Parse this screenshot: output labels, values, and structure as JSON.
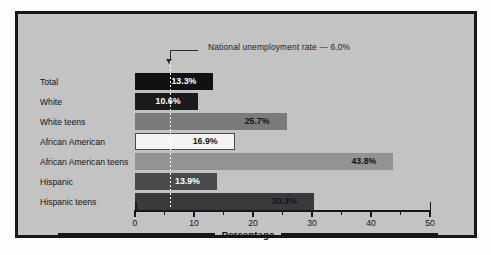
{
  "chart_data": {
    "type": "bar",
    "orientation": "horizontal",
    "title": "",
    "subtitle": "",
    "xlabel": "Percentage",
    "ylabel": "",
    "xlim": [
      0,
      50
    ],
    "xticks": [
      0,
      10,
      20,
      30,
      40,
      50
    ],
    "xtick_labels": [
      "0",
      "10",
      "20",
      "30",
      "40",
      "50"
    ],
    "minor_tick_interval": 5,
    "grid": false,
    "legend": "none",
    "categories": [
      "Total",
      "White",
      "White teens",
      "African American",
      "African American teens",
      "Hispanic",
      "Hispanic teens"
    ],
    "values": [
      13.3,
      10.6,
      25.7,
      16.9,
      43.8,
      13.9,
      30.3
    ],
    "value_labels": [
      "13.3%",
      "10.6%",
      "25.7%",
      "16.9%",
      "43.8%",
      "13.9%",
      "30.3%"
    ],
    "bar_colors": [
      "#111114",
      "#1b1b1e",
      "#7b7b7b",
      "#f4f4f2",
      "#939393",
      "#4a4a4c",
      "#3a3a3c"
    ],
    "label_colors": [
      "#ffffff",
      "#ffffff",
      "#141417",
      "#141417",
      "#141417",
      "#ffffff",
      "#141417"
    ],
    "annotations": [
      {
        "text": "National unemployment rate — 6.0%",
        "value": 6.0,
        "style": "dotted-vertical-line-with-arrow"
      }
    ]
  },
  "axis": {
    "title": "Percentage",
    "ticks": [
      {
        "label": "0",
        "value": 0
      },
      {
        "label": "10",
        "value": 10
      },
      {
        "label": "20",
        "value": 20
      },
      {
        "label": "30",
        "value": 30
      },
      {
        "label": "40",
        "value": 40
      },
      {
        "label": "50",
        "value": 50
      }
    ]
  },
  "colors": {
    "frame": "#17171a",
    "panel_background": "#c3c3c3",
    "page_background": "#fdfdfd",
    "reference_line": "#ffffff",
    "text": "#141417"
  }
}
